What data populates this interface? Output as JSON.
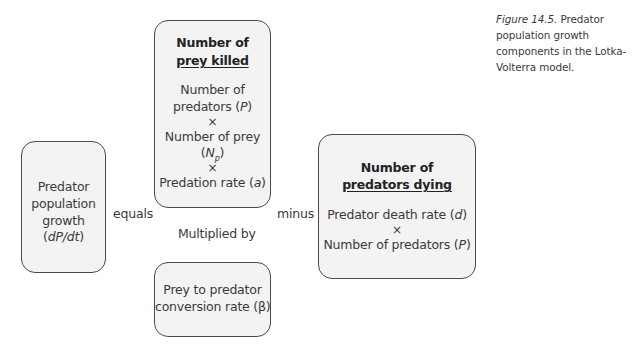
{
  "caption": {
    "figure_label": "Figure 14.5.",
    "text": " Predator population growth components in the Lotka-Volterra model."
  },
  "boxes": {
    "growth": {
      "lines": [
        "Predator",
        "population",
        "growth"
      ],
      "var_prefix": "(",
      "var": "dP/dt",
      "var_suffix": ")"
    },
    "prey_killed": {
      "title_line1": "Number of",
      "title_line2": "prey killed",
      "l1": "Number of",
      "l2_pre": "predators (",
      "l2_var": "P",
      "l2_post": ")",
      "times1": "×",
      "l3": "Number of prey",
      "l4_pre": "(",
      "l4_var": "N",
      "l4_sub": "p",
      "l4_post": ")",
      "times2": "×",
      "l5_pre": "Predation rate (",
      "l5_var": "a",
      "l5_post": ")"
    },
    "conversion": {
      "line1": "Prey to predator",
      "line2": "conversion rate (β)"
    },
    "predators_dying": {
      "title_line1": "Number of",
      "title_line2": "predators dying",
      "l1_pre": "Predator death rate (",
      "l1_var": "d",
      "l1_post": ")",
      "times": "×",
      "l2_pre": "Number of predators (",
      "l2_var": "P",
      "l2_post": ")"
    }
  },
  "operators": {
    "equals": "equals",
    "minus": "minus",
    "multiplied_by": "Multiplied by"
  },
  "colors": {
    "box_fill": "#f3f3f3",
    "box_border": "#4a4a4a",
    "text": "#3a3a3a"
  }
}
